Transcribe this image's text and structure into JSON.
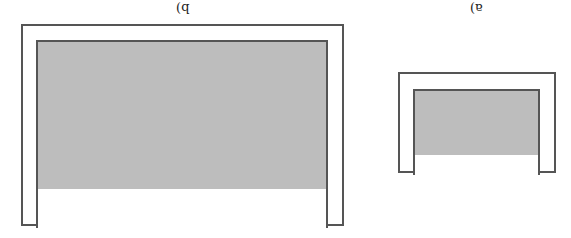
{
  "figures": [
    {
      "id": "b",
      "label": "b)"
    },
    {
      "id": "a",
      "label": "a)"
    }
  ],
  "colors": {
    "outline": "#555555",
    "fill": "#bdbdbd",
    "background": "#ffffff"
  }
}
